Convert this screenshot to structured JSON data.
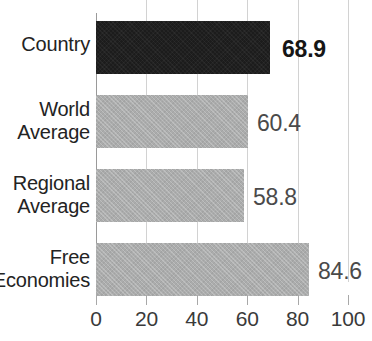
{
  "chart_data": {
    "type": "bar",
    "orientation": "horizontal",
    "title": "",
    "xlabel": "",
    "ylabel": "",
    "xlim": [
      0,
      100
    ],
    "xticks": [
      "0",
      "20",
      "40",
      "60",
      "80",
      "100"
    ],
    "xtick_values": [
      0,
      20,
      40,
      60,
      80,
      100
    ],
    "grid": true,
    "legend": "none",
    "categories": [
      "Country",
      "World Average",
      "Regional Average",
      "Free Economies"
    ],
    "values": [
      68.9,
      60.4,
      58.8,
      84.6
    ],
    "value_labels": [
      "68.9",
      "60.4",
      "58.8",
      "84.6"
    ],
    "bars": [
      {
        "category": "Country",
        "label_lines": [
          "Country"
        ],
        "value": 68.9,
        "value_label": "68.9",
        "color": "#1c1c1c",
        "emphasis": true
      },
      {
        "category": "World Average",
        "label_lines": [
          "World",
          "Average"
        ],
        "value": 60.4,
        "value_label": "60.4",
        "color": "#abacac",
        "emphasis": false
      },
      {
        "category": "Regional Average",
        "label_lines": [
          "Regional",
          "Average"
        ],
        "value": 58.8,
        "value_label": "58.8",
        "color": "#abacac",
        "emphasis": false
      },
      {
        "category": "Free Economies",
        "label_lines": [
          "Free",
          "Economies"
        ],
        "value": 84.6,
        "value_label": "84.6",
        "color": "#abacac",
        "emphasis": false
      }
    ],
    "colors": {
      "highlight_bar": "#1c1c1c",
      "default_bar": "#abacac",
      "gridline": "#d2d2d2",
      "axis": "#9a9a9a",
      "text": "#232323",
      "value_text": "#4a4a4a",
      "background": "#ffffff"
    }
  }
}
